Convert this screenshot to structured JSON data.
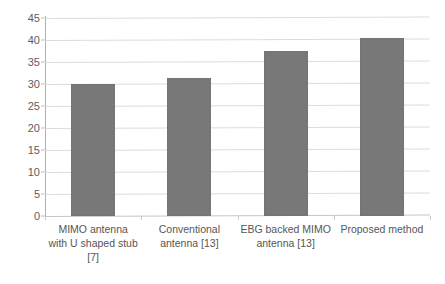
{
  "chart_data": {
    "type": "bar",
    "title": "",
    "subtitle": "",
    "xlabel": "",
    "ylabel": "",
    "categories": [
      "MIMO antenna with U shaped stub [7]",
      "Conventional antenna [13]",
      "EBG backed MIMO antenna [13]",
      "Proposed method"
    ],
    "category_lines": [
      [
        "MIMO antenna",
        "with U shaped stub",
        "[7]"
      ],
      [
        "Conventional",
        "antenna [13]"
      ],
      [
        "EBG backed MIMO",
        "antenna [13]"
      ],
      [
        "Proposed method"
      ]
    ],
    "values": [
      30.0,
      31.3,
      37.4,
      40.5
    ],
    "ylim": [
      0,
      45
    ],
    "ytick_step": 5,
    "ytick_labels": [
      "0",
      "5",
      "10",
      "15",
      "20",
      "25",
      "30",
      "35",
      "40",
      "45"
    ],
    "ytick_values": [
      0,
      5,
      10,
      15,
      20,
      25,
      30,
      35,
      40,
      45
    ],
    "grid": "horizontal",
    "legend": null,
    "legend_position": "none",
    "series": [
      {
        "name": "",
        "values": [
          30.0,
          31.3,
          37.4,
          40.5
        ]
      }
    ]
  },
  "colors": {
    "bar_fill": "#787878",
    "gridline": "#dcdcdc",
    "axis_line": "#b0b0b0",
    "tick_text": "#5e5e5e",
    "background": "#ffffff"
  }
}
